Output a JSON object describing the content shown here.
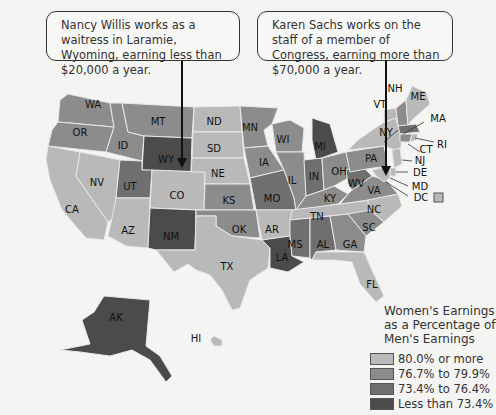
{
  "callouts": [
    {
      "text": "Nancy Willis works as a waitress in Laramie, Wyoming, earning less than $20,000 a year."
    },
    {
      "text": "Karen Sachs works on the staff of a member of Congress, earning more than $70,000 a year."
    }
  ],
  "legend": {
    "title": "Women's Earnings as a Percentage of Men's Earnings",
    "items": [
      {
        "label": "80.0% or more",
        "color": "#b9b9b9"
      },
      {
        "label": "76.7% to 79.9%",
        "color": "#8c8c8c"
      },
      {
        "label": "73.4% to 76.4%",
        "color": "#6f6f6f"
      },
      {
        "label": "Less than 73.4%",
        "color": "#4b4b4b"
      }
    ],
    "average": "U.S. average: 78.0%"
  },
  "states": {
    "WA": "b2",
    "OR": "b2",
    "CA": "b1",
    "NV": "b1",
    "ID": "b2",
    "MT": "b2",
    "WY": "b4",
    "UT": "b3",
    "AZ": "b1",
    "CO": "b1",
    "NM": "b4",
    "ND": "b1",
    "SD": "b1",
    "NE": "b1",
    "KS": "b2",
    "OK": "b2",
    "TX": "b1",
    "MN": "b2",
    "IA": "b2",
    "MO": "b3",
    "AR": "b1",
    "LA": "b4",
    "WI": "b2",
    "IL": "b2",
    "MI": "b4",
    "IN": "b3",
    "OH": "b2",
    "KY": "b2",
    "TN": "b1",
    "MS": "b3",
    "AL": "b3",
    "GA": "b2",
    "FL": "b1",
    "SC": "b2",
    "NC": "b1",
    "VA": "b2",
    "WV": "b3",
    "PA": "b2",
    "NY": "b1",
    "VT": "b1",
    "NH": "b2",
    "ME": "b1",
    "MA": "b3",
    "RI": "b1",
    "CT": "b2",
    "NJ": "b1",
    "DE": "b1",
    "MD": "b1",
    "DC": "b1",
    "AK": "b4",
    "HI": "b1"
  }
}
